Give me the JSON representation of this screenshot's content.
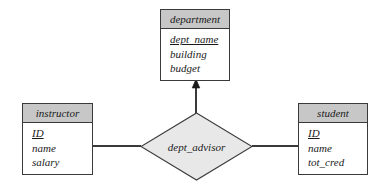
{
  "diagram": {
    "type": "entity-relationship-diagram",
    "colors": {
      "header_fill": "#c7c7c7",
      "diamond_fill": "#e8e8e8",
      "stroke": "#3a3a3a",
      "background": "#ffffff",
      "text": "#1a1a1a"
    }
  },
  "entities": {
    "department": {
      "name": "department",
      "attributes": [
        {
          "label": "dept_name",
          "primary_key": true
        },
        {
          "label": "building",
          "primary_key": false
        },
        {
          "label": "budget",
          "primary_key": false
        }
      ]
    },
    "instructor": {
      "name": "instructor",
      "attributes": [
        {
          "label": "ID",
          "primary_key": true
        },
        {
          "label": "name",
          "primary_key": false
        },
        {
          "label": "salary",
          "primary_key": false
        }
      ]
    },
    "student": {
      "name": "student",
      "attributes": [
        {
          "label": "ID",
          "primary_key": true
        },
        {
          "label": "name",
          "primary_key": false
        },
        {
          "label": "tot_cred",
          "primary_key": false
        }
      ]
    }
  },
  "relationships": [
    {
      "name": "dept_advisor",
      "participants": [
        "instructor",
        "student",
        "department"
      ],
      "arrow_to": "department"
    }
  ],
  "edges": [
    {
      "from": "instructor",
      "to": "dept_advisor",
      "arrow": false
    },
    {
      "from": "student",
      "to": "dept_advisor",
      "arrow": false
    },
    {
      "from": "dept_advisor",
      "to": "department",
      "arrow": true
    }
  ]
}
